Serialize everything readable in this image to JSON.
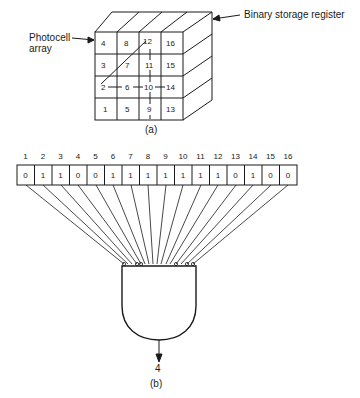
{
  "part_a": {
    "caption": "(a)",
    "label_photocell": "Photocell array",
    "label_photocell_line1": "Photocell",
    "label_photocell_line2": "array",
    "label_register": "Binary storage register",
    "grid_rows": [
      [
        "4",
        "8",
        "12",
        "16"
      ],
      [
        "3",
        "7",
        "11",
        "15"
      ],
      [
        "2",
        "6",
        "10",
        "14"
      ],
      [
        "1",
        "5",
        "9",
        "13"
      ]
    ],
    "pattern_note": "Lines connect cells 2-7-12 (diagonal), 2-6-10-14 (horizontal), 12-11-10-9 (vertical)"
  },
  "part_b": {
    "caption": "(b)",
    "register_indices": [
      "1",
      "2",
      "3",
      "4",
      "5",
      "6",
      "7",
      "8",
      "9",
      "10",
      "11",
      "12",
      "13",
      "14",
      "15",
      "16"
    ],
    "register_bits": [
      "0",
      "1",
      "1",
      "0",
      "0",
      "1",
      "1",
      "1",
      "1",
      "1",
      "1",
      "1",
      "0",
      "1",
      "0",
      "0"
    ],
    "gate_output": "4"
  }
}
